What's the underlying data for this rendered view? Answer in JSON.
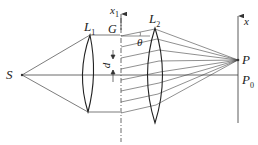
{
  "diagram": {
    "type": "optics-grating-setup",
    "labels": {
      "source": "S",
      "lens1": "L",
      "lens1_sub": "1",
      "lens2": "L",
      "lens2_sub": "2",
      "grating": "G",
      "grating_axis": "x",
      "grating_axis_sub": "1",
      "screen_axis": "x",
      "point_p": "P",
      "point_p0": "P",
      "point_p0_sub": "0",
      "angle": "θ",
      "spacing": "d"
    },
    "colors": {
      "line": "#333333",
      "background": "#ffffff"
    }
  }
}
